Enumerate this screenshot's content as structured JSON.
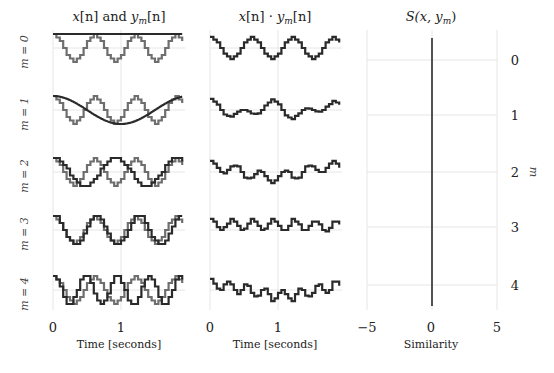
{
  "chart_data": [
    {
      "type": "line",
      "panel": "signals",
      "title": "x[n] and y_m[n]",
      "title_parts": {
        "a": "x",
        "b": "[n] and ",
        "c": "y",
        "sub": "m",
        "d": "[n]"
      },
      "xlabel": "Time [seconds]",
      "xticks": [
        "0",
        "1"
      ],
      "xlim": [
        0,
        1.9
      ],
      "row_labels": [
        "m = 0",
        "m = 1",
        "m = 2",
        "m = 3",
        "m = 4"
      ],
      "x_signal": {
        "name": "x[n]",
        "freq_hz": 1.667,
        "phase": 0.0,
        "amplitude": 1,
        "quantization_levels": 8,
        "sample_rate": 20,
        "color": "#6e6e6e"
      },
      "y_signals": [
        {
          "m": 0,
          "name": "y_0[n]",
          "freq_hz": 0.0,
          "color": "#2a2a2a"
        },
        {
          "m": 1,
          "name": "y_1[n]",
          "freq_hz": 0.5,
          "color": "#2a2a2a"
        },
        {
          "m": 2,
          "name": "y_2[n]",
          "freq_hz": 1.1,
          "color": "#2a2a2a"
        },
        {
          "m": 3,
          "name": "y_3[n]",
          "freq_hz": 1.6,
          "color": "#2a2a2a"
        },
        {
          "m": 4,
          "name": "y_4[n]",
          "freq_hz": 2.15,
          "color": "#2a2a2a"
        }
      ]
    },
    {
      "type": "line",
      "panel": "products",
      "title": "x[n] · y_m[n]",
      "title_parts": {
        "a": "x",
        "b": "[n] · ",
        "c": "y",
        "sub": "m",
        "d": "[n]"
      },
      "xlabel": "Time [seconds]",
      "xticks": [
        "0",
        "1"
      ],
      "xlim": [
        0,
        1.9
      ],
      "series": "product of x[n] and y_m[n] for m = 0..4",
      "color": "#2a2a2a"
    },
    {
      "type": "bar",
      "panel": "similarity",
      "title": "S(x, y_m)",
      "title_parts": {
        "a": "S(x, y",
        "sub": "m",
        "d": ")"
      },
      "xlabel": "Similarity",
      "xticks": [
        "−5",
        "0",
        "5"
      ],
      "xticks_values": [
        -5,
        0,
        5
      ],
      "xlim": [
        -5,
        5
      ],
      "categories": [
        "0",
        "1",
        "2",
        "3",
        "4"
      ],
      "ylabel": "m",
      "values": [
        0,
        0,
        0,
        0,
        0
      ],
      "color": "#2a2a2a"
    }
  ]
}
